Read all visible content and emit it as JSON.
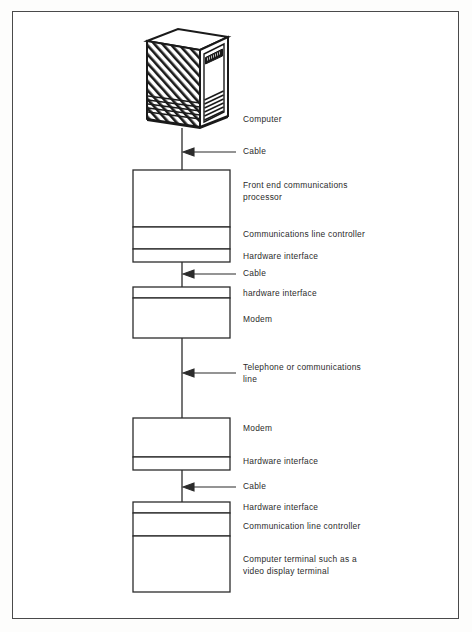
{
  "diagram": {
    "stroke_color": "#2b2b2b",
    "border_color": "#4a4a4a",
    "background_color": "#ffffff",
    "nodes": [
      {
        "id": "computer",
        "kind": "mainframe-illustration",
        "label": "Computer"
      },
      {
        "id": "front-end-processor",
        "kind": "box",
        "label": "Front end communications\nprocessor"
      },
      {
        "id": "comms-line-controller-top",
        "kind": "box",
        "label": "Communications line controller"
      },
      {
        "id": "hardware-interface-fep",
        "kind": "thin-box",
        "label": "Hardware interface"
      },
      {
        "id": "hardware-interface-modem-top",
        "kind": "thin-box",
        "label": "hardware interface"
      },
      {
        "id": "modem-top",
        "kind": "box",
        "label": "Modem"
      },
      {
        "id": "modem-bottom",
        "kind": "box",
        "label": "Modem"
      },
      {
        "id": "hardware-interface-modem-bottom",
        "kind": "thin-box",
        "label": "Hardware interface"
      },
      {
        "id": "hardware-interface-terminal",
        "kind": "thin-box",
        "label": "Hardware interface"
      },
      {
        "id": "comms-line-controller-bottom",
        "kind": "box",
        "label": "Communication line controller"
      },
      {
        "id": "terminal",
        "kind": "box",
        "label": "Computer terminal such as a\nvideo display terminal"
      }
    ],
    "connectors": [
      {
        "id": "cable-computer-to-fep",
        "label": "Cable",
        "arrow": "left"
      },
      {
        "id": "cable-fep-to-modem",
        "label": "Cable",
        "arrow": "left"
      },
      {
        "id": "telephone-line",
        "label": "Telephone or communications\nline",
        "arrow": "left"
      },
      {
        "id": "cable-modem-to-terminal",
        "label": "Cable",
        "arrow": "left"
      }
    ]
  }
}
